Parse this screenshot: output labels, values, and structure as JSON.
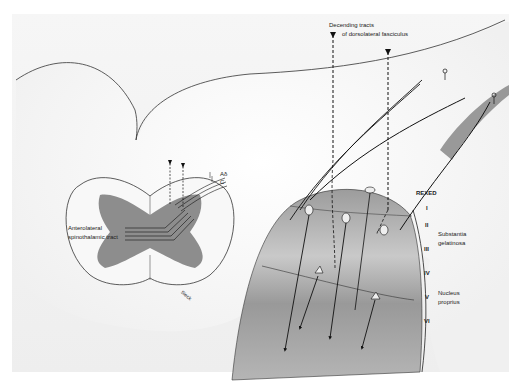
{
  "figure": {
    "background_color": "#f2f2f2",
    "gray_matter_color": "#9a9a9a",
    "line_color": "#1a1a1a"
  },
  "labels": {
    "descending_tracts_line1": "Decending tracts",
    "descending_tracts_line2": "of dorsolateral fasciculus",
    "anterolateral_line1": "Anterolateral",
    "anterolateral_line2": "spinothalamic tract",
    "fiber_a_delta": "Aδ",
    "fiber_c": "C",
    "signature": "Sieck",
    "rexed_header": "REXED",
    "substantia_line1": "Substantia",
    "substantia_line2": "gelatinosa",
    "nucleus_line1": "Nucleus",
    "nucleus_line2": "proprius"
  },
  "laminae": [
    {
      "numeral": "I",
      "y": 216
    },
    {
      "numeral": "II",
      "y": 228
    },
    {
      "numeral": "III",
      "y": 250
    },
    {
      "numeral": "IV",
      "y": 272
    },
    {
      "numeral": "V",
      "y": 296
    },
    {
      "numeral": "VI",
      "y": 322
    }
  ]
}
